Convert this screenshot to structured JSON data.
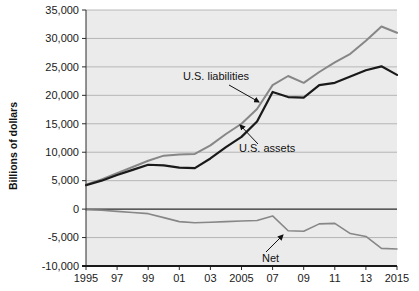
{
  "chart_data": {
    "type": "line",
    "title": "",
    "subtitle": "",
    "xlabel": "",
    "ylabel": "Billions of dollars",
    "x": [
      1995,
      1996,
      1997,
      1998,
      1999,
      2000,
      2001,
      2002,
      2003,
      2004,
      2005,
      2006,
      2007,
      2008,
      2009,
      2010,
      2011,
      2012,
      2013,
      2014,
      2015
    ],
    "xlim": [
      1995,
      2015
    ],
    "ylim": [
      -10000,
      35000
    ],
    "ytick_values": [
      -10000,
      -5000,
      0,
      5000,
      10000,
      15000,
      20000,
      25000,
      30000,
      35000
    ],
    "ytick_labels": [
      "-10,000",
      "-5,000",
      "0",
      "5,000",
      "10,000",
      "15,000",
      "20,000",
      "25,000",
      "30,000",
      "35,000"
    ],
    "xtick_values": [
      1995,
      1997,
      1999,
      2001,
      2003,
      2005,
      2007,
      2009,
      2011,
      2013,
      2015
    ],
    "xtick_labels": [
      "1995",
      "97",
      "99",
      "01",
      "03",
      "2005",
      "07",
      "09",
      "11",
      "13",
      "2015"
    ],
    "grid": true,
    "grid_axis": "y",
    "legend": "none",
    "plot_background": "#ebebeb",
    "series": [
      {
        "name": "U.S. liabilities",
        "color": "#878787",
        "width": 2.0,
        "values": [
          4300,
          5200,
          6300,
          7400,
          8500,
          9400,
          9600,
          9700,
          11200,
          13200,
          15000,
          17600,
          21800,
          23400,
          22200,
          24100,
          25800,
          27300,
          29600,
          32100,
          31000
        ]
      },
      {
        "name": "U.S. assets",
        "color": "#1a1a1a",
        "width": 2.2,
        "values": [
          4200,
          5000,
          6000,
          6900,
          7800,
          7700,
          7300,
          7200,
          8900,
          10900,
          12700,
          15400,
          20600,
          19700,
          19600,
          21800,
          22200,
          23300,
          24400,
          25100,
          23600
        ]
      },
      {
        "name": "Net",
        "color": "#878787",
        "width": 1.6,
        "values": [
          -100,
          -200,
          -400,
          -600,
          -800,
          -1500,
          -2200,
          -2400,
          -2300,
          -2200,
          -2100,
          -2000,
          -1200,
          -3800,
          -3900,
          -2600,
          -2500,
          -4300,
          -4800,
          -6900,
          -7000
        ]
      }
    ],
    "annotations": [
      {
        "name": "us-liabilities",
        "label": "U.S. liabilities",
        "text_x": 183,
        "text_y": 80,
        "arrow_x1": 229,
        "arrow_y1": 85,
        "arrow_x2": 259,
        "arrow_y2": 102
      },
      {
        "name": "us-assets",
        "label": "U.S. assets",
        "text_x": 239,
        "text_y": 152,
        "arrow_x1": 258,
        "arrow_y1": 144,
        "arrow_x2": 240,
        "arrow_y2": 125
      },
      {
        "name": "net",
        "label": "Net",
        "text_x": 262,
        "text_y": 262,
        "arrow_x1": 266,
        "arrow_y1": 252,
        "arrow_x2": 283,
        "arrow_y2": 235
      }
    ]
  }
}
